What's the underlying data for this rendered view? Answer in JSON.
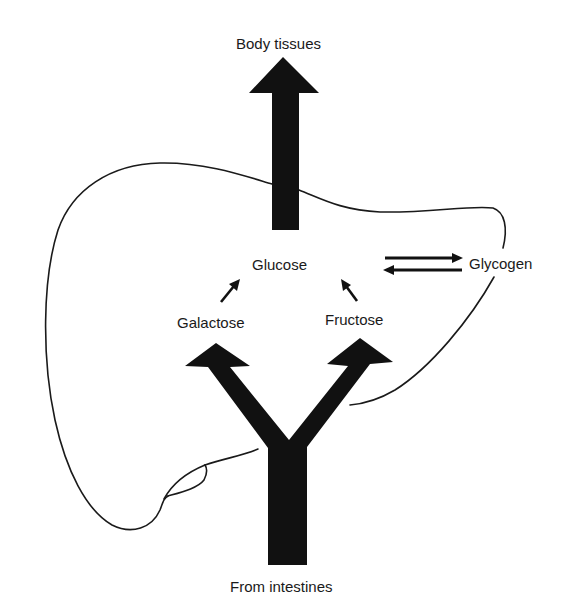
{
  "diagram": {
    "labels": {
      "body_tissues": "Body tissues",
      "glucose": "Glucose",
      "glycogen": "Glycogen",
      "galactose": "Galactose",
      "fructose": "Fructose",
      "from_intestines": "From intestines"
    },
    "colors": {
      "ink": "#111111",
      "outline": "#1a1a1a",
      "background": "#ffffff"
    },
    "nodes": [
      {
        "id": "from_intestines",
        "label": "From intestines"
      },
      {
        "id": "galactose",
        "label": "Galactose"
      },
      {
        "id": "fructose",
        "label": "Fructose"
      },
      {
        "id": "glucose",
        "label": "Glucose"
      },
      {
        "id": "glycogen",
        "label": "Glycogen"
      },
      {
        "id": "body_tissues",
        "label": "Body tissues"
      }
    ],
    "edges": [
      {
        "from": "from_intestines",
        "to": "galactose",
        "style": "thick"
      },
      {
        "from": "from_intestines",
        "to": "fructose",
        "style": "thick"
      },
      {
        "from": "galactose",
        "to": "glucose",
        "style": "thin"
      },
      {
        "from": "fructose",
        "to": "glucose",
        "style": "thin"
      },
      {
        "from": "glucose",
        "to": "glycogen",
        "style": "medium",
        "reversible": true
      },
      {
        "from": "glycogen",
        "to": "glucose",
        "style": "medium"
      },
      {
        "from": "glucose",
        "to": "body_tissues",
        "style": "thick"
      }
    ],
    "organ_outline": "liver"
  }
}
